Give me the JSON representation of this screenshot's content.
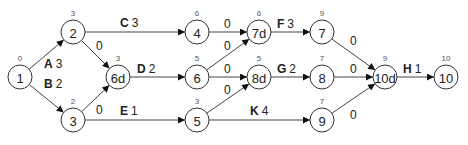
{
  "nodes": [
    {
      "id": "1",
      "label": "1",
      "time": "0",
      "x": 20,
      "y": 77
    },
    {
      "id": "2",
      "label": "2",
      "time": "3",
      "x": 73,
      "y": 32
    },
    {
      "id": "3",
      "label": "3",
      "time": "2",
      "x": 73,
      "y": 120
    },
    {
      "id": "6d",
      "label": "6d",
      "time": "3",
      "x": 118,
      "y": 77
    },
    {
      "id": "4",
      "label": "4",
      "time": "6",
      "x": 197,
      "y": 32
    },
    {
      "id": "6",
      "label": "6",
      "time": "5",
      "x": 197,
      "y": 77
    },
    {
      "id": "5",
      "label": "5",
      "time": "3",
      "x": 197,
      "y": 120
    },
    {
      "id": "7d",
      "label": "7d",
      "time": "6",
      "x": 259,
      "y": 32
    },
    {
      "id": "8d",
      "label": "8d",
      "time": "5",
      "x": 259,
      "y": 77
    },
    {
      "id": "7",
      "label": "7",
      "time": "9",
      "x": 322,
      "y": 32
    },
    {
      "id": "8",
      "label": "8",
      "time": "7",
      "x": 322,
      "y": 77
    },
    {
      "id": "9",
      "label": "9",
      "time": "7",
      "x": 322,
      "y": 120
    },
    {
      "id": "10d",
      "label": "10d",
      "time": "9",
      "x": 385,
      "y": 77
    },
    {
      "id": "10",
      "label": "10",
      "time": "10",
      "x": 446,
      "y": 77
    }
  ],
  "edges": [
    {
      "from": "1",
      "to": "2",
      "activity": "A",
      "duration": "3",
      "lx": 44,
      "ly": 68
    },
    {
      "from": "1",
      "to": "3",
      "activity": "B",
      "duration": "2",
      "lx": 44,
      "ly": 88
    },
    {
      "from": "2",
      "to": "4",
      "activity": "C",
      "duration": "3",
      "lx": 120,
      "ly": 27
    },
    {
      "from": "2",
      "to": "6d",
      "activity": "",
      "duration": "0",
      "lx": 96,
      "ly": 50
    },
    {
      "from": "3",
      "to": "6d",
      "activity": "",
      "duration": "0",
      "lx": 96,
      "ly": 114
    },
    {
      "from": "3",
      "to": "5",
      "activity": "E",
      "duration": "1",
      "lx": 120,
      "ly": 115
    },
    {
      "from": "6d",
      "to": "6",
      "activity": "D",
      "duration": "2",
      "lx": 137,
      "ly": 73
    },
    {
      "from": "4",
      "to": "7d",
      "activity": "",
      "duration": "0",
      "lx": 224,
      "ly": 28
    },
    {
      "from": "6",
      "to": "7d",
      "activity": "",
      "duration": "0",
      "lx": 224,
      "ly": 50
    },
    {
      "from": "6",
      "to": "8d",
      "activity": "",
      "duration": "0",
      "lx": 224,
      "ly": 73
    },
    {
      "from": "5",
      "to": "8d",
      "activity": "",
      "duration": "0",
      "lx": 224,
      "ly": 94
    },
    {
      "from": "5",
      "to": "9",
      "activity": "K",
      "duration": "4",
      "lx": 250,
      "ly": 115
    },
    {
      "from": "7d",
      "to": "7",
      "activity": "F",
      "duration": "3",
      "lx": 277,
      "ly": 28
    },
    {
      "from": "8d",
      "to": "8",
      "activity": "G",
      "duration": "2",
      "lx": 277,
      "ly": 73
    },
    {
      "from": "7",
      "to": "10d",
      "activity": "",
      "duration": "0",
      "lx": 350,
      "ly": 45
    },
    {
      "from": "8",
      "to": "10d",
      "activity": "",
      "duration": "0",
      "lx": 350,
      "ly": 73
    },
    {
      "from": "9",
      "to": "10d",
      "activity": "",
      "duration": "0",
      "lx": 350,
      "ly": 119
    },
    {
      "from": "10d",
      "to": "10",
      "activity": "H",
      "duration": "1",
      "lx": 403,
      "ly": 73
    }
  ]
}
